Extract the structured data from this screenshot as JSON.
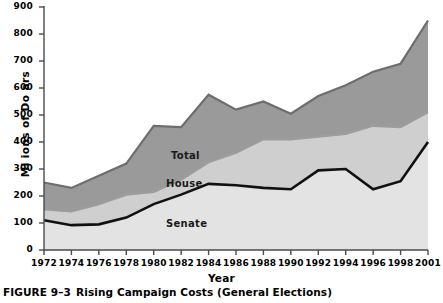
{
  "figure": {
    "caption_number": "FIGURE 9–3",
    "caption_text": "Rising Campaign Costs (General Elections)"
  },
  "colors": {
    "total_line": "#6e6e6e",
    "total_fill": "#9a9a9a",
    "house_line": "#9d9d9d",
    "house_fill": "#cfcfcf",
    "senate_line": "#111111",
    "senate_fill": "#e3e3e3",
    "axis": "#4a4a4a",
    "background": "#ffffff",
    "text": "#000000"
  },
  "labels": {
    "total": "Total",
    "house": "House",
    "senate": "Senate"
  },
  "chart_data": {
    "type": "area",
    "title": "Rising Campaign Costs (General Elections)",
    "xlabel": "Year",
    "ylabel": "Mi ions of Do ars",
    "grid": false,
    "legend": "inline-annotations",
    "xlim": [
      1972,
      2001
    ],
    "ylim": [
      0,
      900
    ],
    "ytick_labels": [
      "900",
      "800",
      "700",
      "600",
      "500",
      "400",
      "300",
      "200",
      "100",
      "0"
    ],
    "yticks": [
      900,
      800,
      700,
      600,
      500,
      400,
      300,
      200,
      100,
      0
    ],
    "xtick_labels": [
      "1972",
      "1974",
      "1976",
      "1978",
      "1980",
      "1982",
      "1984",
      "1986",
      "1988",
      "1990",
      "1992",
      "1994",
      "1996",
      "1998",
      "2001"
    ],
    "xticks": [
      1972,
      1974,
      1976,
      1978,
      1980,
      1982,
      1984,
      1986,
      1988,
      1990,
      1992,
      1994,
      1996,
      1998,
      2001
    ],
    "x": [
      1972,
      1974,
      1976,
      1978,
      1980,
      1982,
      1984,
      1986,
      1988,
      1990,
      1992,
      1994,
      1996,
      1998,
      2001
    ],
    "series": [
      {
        "name": "Total",
        "values": [
          250,
          230,
          275,
          320,
          460,
          455,
          575,
          520,
          550,
          505,
          570,
          610,
          660,
          690,
          850
        ]
      },
      {
        "name": "House",
        "values": [
          150,
          143,
          170,
          205,
          215,
          260,
          325,
          360,
          410,
          410,
          420,
          430,
          460,
          455,
          510
        ]
      },
      {
        "name": "Senate",
        "values": [
          110,
          92,
          95,
          120,
          170,
          205,
          245,
          240,
          230,
          225,
          295,
          300,
          225,
          255,
          400
        ]
      }
    ]
  }
}
